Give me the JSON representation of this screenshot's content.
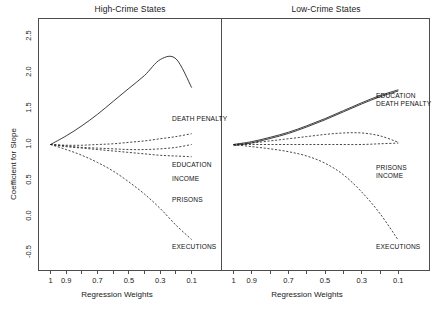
{
  "figure": {
    "ylabel": "Coefficient for Slope",
    "xlabel_left": "Regression Weights",
    "xlabel_right": "Regression Weights",
    "panel_left_title": "High-Crime States",
    "panel_right_title": "Low-Crime States"
  },
  "labels_left": {
    "death_penalty": "DEATH PENALTY",
    "education": "EDUCATION",
    "income": "INCOME",
    "prisons": "PRISONS",
    "executions": "EXECUTIONS"
  },
  "labels_right": {
    "education": "EDUCATION",
    "death_penalty": "DEATH PENALTY",
    "prisons": "PRISONS",
    "income": "INCOME",
    "executions": "EXECUTIONS"
  },
  "yticks": [
    "-0.5",
    "0.0",
    "0.5",
    "1.0",
    "1.5",
    "2.0",
    "2.5"
  ],
  "xticks": [
    "1",
    "0.9",
    "0.7",
    "0.5",
    "0.3",
    "0.1"
  ],
  "colors": {
    "line": "#1a1a1a",
    "frame": "#4d4d4d",
    "text": "#1a1a1a"
  },
  "chart_data": {
    "type": "line",
    "xlabel": "Regression Weights",
    "ylabel": "Coefficient for Slope",
    "xlim": [
      1.0,
      0.05
    ],
    "ylim": [
      -0.75,
      2.75
    ],
    "x_reversed": true,
    "grid": false,
    "legend": "inline-right-labels",
    "xticks": [
      1,
      0.9,
      0.7,
      0.5,
      0.3,
      0.1
    ],
    "yticks": [
      -0.5,
      0.0,
      0.5,
      1.0,
      1.5,
      2.0,
      2.5
    ],
    "panels": [
      {
        "title": "High-Crime States",
        "x": [
          1.0,
          0.9,
          0.8,
          0.7,
          0.6,
          0.5,
          0.4,
          0.3,
          0.2,
          0.1
        ],
        "series": [
          {
            "name": "DEATH PENALTY",
            "style": "solid",
            "values": [
              1.0,
              1.12,
              1.26,
              1.42,
              1.6,
              1.78,
              1.96,
              2.18,
              2.19,
              1.79
            ]
          },
          {
            "name": "EDUCATION",
            "style": "dashed",
            "values": [
              1.0,
              0.99,
              0.99,
              1.0,
              1.01,
              1.03,
              1.05,
              1.08,
              1.11,
              1.15
            ]
          },
          {
            "name": "INCOME",
            "style": "dashed",
            "values": [
              1.0,
              0.98,
              0.96,
              0.95,
              0.94,
              0.93,
              0.93,
              0.94,
              0.96,
              1.0
            ]
          },
          {
            "name": "PRISONS",
            "style": "dashed",
            "values": [
              1.0,
              0.97,
              0.95,
              0.93,
              0.91,
              0.89,
              0.87,
              0.85,
              0.84,
              0.83
            ]
          },
          {
            "name": "EXECUTIONS",
            "style": "dashed",
            "values": [
              1.0,
              0.93,
              0.85,
              0.75,
              0.63,
              0.48,
              0.31,
              0.11,
              -0.12,
              -0.32
            ]
          }
        ]
      },
      {
        "title": "Low-Crime States",
        "x": [
          1.0,
          0.9,
          0.8,
          0.7,
          0.6,
          0.5,
          0.4,
          0.3,
          0.2,
          0.1
        ],
        "series": [
          {
            "name": "EDUCATION",
            "style": "solid",
            "values": [
              1.0,
              1.04,
              1.1,
              1.17,
              1.26,
              1.36,
              1.47,
              1.58,
              1.68,
              1.76
            ]
          },
          {
            "name": "DEATH PENALTY",
            "style": "solid",
            "values": [
              1.0,
              1.04,
              1.1,
              1.17,
              1.26,
              1.36,
              1.47,
              1.58,
              1.68,
              1.76
            ]
          },
          {
            "name": "PRISONS",
            "style": "dashed",
            "values": [
              1.0,
              1.02,
              1.05,
              1.08,
              1.11,
              1.14,
              1.16,
              1.16,
              1.12,
              1.03
            ]
          },
          {
            "name": "INCOME",
            "style": "dashed",
            "values": [
              1.0,
              1.0,
              1.0,
              1.0,
              1.0,
              1.0,
              1.0,
              1.0,
              1.01,
              1.02
            ]
          },
          {
            "name": "EXECUTIONS",
            "style": "dashed",
            "values": [
              1.0,
              0.97,
              0.94,
              0.9,
              0.84,
              0.74,
              0.58,
              0.34,
              0.04,
              -0.33
            ]
          }
        ]
      }
    ]
  }
}
